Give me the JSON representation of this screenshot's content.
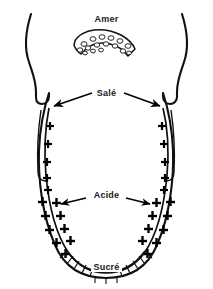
{
  "figure": {
    "colors": {
      "outline": "#111111",
      "text": "#1a1a1a",
      "background": "#ffffff",
      "marker": "#000000"
    },
    "labels": {
      "amer": "Amer",
      "sale": "Salé",
      "acide": "Acide",
      "sucre": "Sucré"
    },
    "zones": [
      {
        "id": "amer",
        "label": "Amer",
        "marker": "papillae-circles",
        "position": "back",
        "papillae_count": 16
      },
      {
        "id": "sale",
        "label": "Salé",
        "marker": "plus-signs",
        "position": "lateral-upper",
        "arrows": 2
      },
      {
        "id": "acide",
        "label": "Acide",
        "marker": "plus-signs",
        "position": "lateral-lower",
        "arrows": 2
      },
      {
        "id": "sucre",
        "label": "Sucré",
        "marker": "hatching",
        "position": "tip",
        "arrows": 0
      }
    ]
  }
}
